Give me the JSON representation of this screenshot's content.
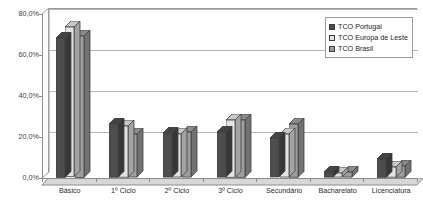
{
  "chart_data": {
    "type": "bar",
    "title": "",
    "subtitle": "",
    "xlabel": "",
    "ylabel": "",
    "ylim": [
      0,
      80
    ],
    "grid": true,
    "legend_position": "top-right",
    "value_suffix": "%",
    "categories": [
      "Básico",
      "1º Ciclo",
      "2º Ciclo",
      "3º Ciclo",
      "Secundário",
      "Bacharelato",
      "Licenciatura"
    ],
    "series": [
      {
        "name": "TCO Portugal",
        "color": "#4d4d4d",
        "values": [
          68.0,
          26.0,
          21.5,
          22.0,
          19.0,
          2.5,
          9.0
        ]
      },
      {
        "name": "TCO Europa de Leste",
        "color": "#e3e3e3",
        "values": [
          73.0,
          25.0,
          21.0,
          28.0,
          21.0,
          2.0,
          5.0
        ]
      },
      {
        "name": "TCO Brasil",
        "color": "#9e9e9e",
        "values": [
          69.0,
          21.0,
          22.0,
          28.0,
          26.0,
          2.5,
          5.5
        ]
      }
    ],
    "y_ticks": [
      {
        "value": 0,
        "label": "0,0%"
      },
      {
        "value": 20,
        "label": "20,0%"
      },
      {
        "value": 40,
        "label": "40,0%"
      },
      {
        "value": 60,
        "label": "60,0%"
      },
      {
        "value": 80,
        "label": "80,0%"
      }
    ]
  },
  "legend": {
    "items": [
      {
        "label": "TCO Portugal"
      },
      {
        "label": "TCO Europa de Leste"
      },
      {
        "label": "TCO Brasil"
      }
    ]
  },
  "colors": {
    "series_1": "#4d4d4d",
    "series_2": "#e3e3e3",
    "series_3": "#9e9e9e",
    "axis": "#8c8c8c",
    "gridline": "#b4b4b4",
    "background": "#ffffff"
  }
}
